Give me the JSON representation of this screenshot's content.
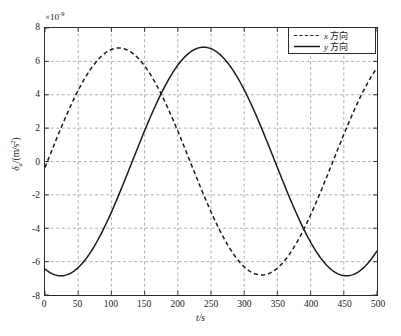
{
  "chart_data": {
    "type": "line",
    "title": "",
    "xlabel": "t/s",
    "ylabel": "δa/(m/s2)",
    "ylabel_symbol": "δ",
    "ylabel_sub": "a",
    "ylabel_unit": "/(m/s",
    "ylabel_unit_sup": "2",
    "ylabel_unit_close": ")",
    "exponent_prefix": "×10",
    "exponent_power": "-9",
    "scale_note": "×10^-9",
    "xlim": [
      0,
      500
    ],
    "ylim": [
      -8,
      8
    ],
    "xticks": [
      0,
      50,
      100,
      150,
      200,
      250,
      300,
      350,
      400,
      450,
      500
    ],
    "yticks": [
      8,
      6,
      4,
      2,
      0,
      -2,
      -4,
      -6,
      -8
    ],
    "xtick_labels": [
      "0",
      "50",
      "100",
      "150",
      "200",
      "250",
      "300",
      "350",
      "400",
      "450",
      "500"
    ],
    "ytick_labels": [
      "8",
      "6",
      "4",
      "2",
      "0",
      "-2",
      "-4",
      "-6",
      "-8"
    ],
    "grid": true,
    "grid_style": "dashed",
    "legend_position": "top-right",
    "legend": [
      {
        "name": "x 方向",
        "style": "dashed",
        "symbol": "x",
        "suffix": " 方向"
      },
      {
        "name": "y 方向",
        "style": "solid",
        "symbol": "y",
        "suffix": " 方向"
      }
    ],
    "series": [
      {
        "name": "x 方向",
        "style": "dashed",
        "color": "#1a1a1a",
        "amplitude": 6.8,
        "period": 430,
        "phase_deg": -3,
        "offset": 0,
        "x": [
          0,
          25,
          50,
          75,
          100,
          105,
          125,
          150,
          175,
          200,
          225,
          250,
          275,
          300,
          320,
          325,
          350,
          375,
          400,
          425,
          450,
          475,
          500
        ],
        "y": [
          0.35,
          2.9,
          4.9,
          6.3,
          6.8,
          6.8,
          6.4,
          5.1,
          3.2,
          0.9,
          -1.6,
          -3.8,
          -5.6,
          -6.6,
          -6.8,
          -6.8,
          -6.2,
          -4.7,
          -2.6,
          -0.1,
          2.4,
          4.3,
          5.5
        ]
      },
      {
        "name": "y 方向",
        "style": "solid",
        "color": "#1a1a1a",
        "amplitude": 6.85,
        "period": 430,
        "phase_deg": -110,
        "offset": 0,
        "x": [
          0,
          25,
          50,
          75,
          100,
          125,
          150,
          175,
          200,
          215,
          225,
          250,
          275,
          300,
          325,
          350,
          375,
          400,
          425,
          433,
          450,
          475,
          500
        ],
        "y": [
          -6.7,
          -6.3,
          -5.1,
          -3.4,
          -1.1,
          1.3,
          3.5,
          5.3,
          6.6,
          6.8,
          6.7,
          5.9,
          4.3,
          2.1,
          -0.4,
          -2.7,
          -4.7,
          -6.2,
          -6.8,
          -6.9,
          -6.7,
          -5.6,
          -3.8
        ]
      }
    ]
  },
  "axis": {
    "exponent_label": "×10-9",
    "x_title": "t/s",
    "y_title": "δa/(m/s2)"
  }
}
